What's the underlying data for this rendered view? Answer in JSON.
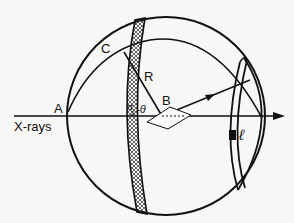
{
  "diagram": {
    "labels": {
      "point_a": "A",
      "point_b": "B",
      "point_c": "C",
      "radius": "R",
      "angle": "π/2-θ",
      "angle_num": "π",
      "angle_den": "2",
      "angle_rest": "-θ",
      "beam": "X-rays",
      "length": "ℓ"
    },
    "colors": {
      "ink": "#111111",
      "paper": "#f7f7f5"
    }
  }
}
